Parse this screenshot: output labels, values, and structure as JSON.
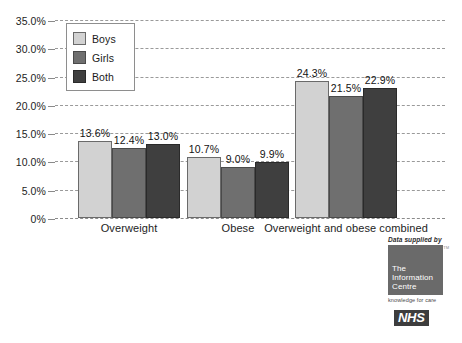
{
  "chart_data": {
    "type": "bar",
    "title": "",
    "xlabel": "",
    "ylabel": "",
    "ylim": [
      0,
      35
    ],
    "grid": true,
    "legend_position": "top-left",
    "categories": [
      "Overweight",
      "Obese",
      "Overweight and obese combined"
    ],
    "series": [
      {
        "name": "Boys",
        "color": "#d2d2d2",
        "values": [
          13.6,
          10.7,
          24.3
        ],
        "labels": [
          "13.6%",
          "10.7%",
          "24.3%"
        ]
      },
      {
        "name": "Girls",
        "color": "#6f6f6f",
        "values": [
          12.4,
          9.0,
          21.5
        ],
        "labels": [
          "12.4%",
          "9.0%",
          "21.5%"
        ]
      },
      {
        "name": "Both",
        "color": "#3f3f3f",
        "values": [
          13.0,
          9.9,
          22.9
        ],
        "labels": [
          "13.0%",
          "9.9%",
          "22.9%"
        ]
      }
    ],
    "yticks": [
      35,
      30,
      25,
      20,
      15,
      10,
      5,
      0
    ],
    "ytick_labels": [
      "35.0%",
      "30.0%",
      "25.0%",
      "20.0%",
      "15.0%",
      "10.0%",
      "5.0%",
      "0%"
    ]
  },
  "legend": {
    "items": [
      {
        "label": "Boys"
      },
      {
        "label": "Girls"
      },
      {
        "label": "Both"
      }
    ]
  },
  "logo": {
    "caption": "Data supplied by",
    "trademark": "TM",
    "box_line1": "The",
    "box_line2": "Information",
    "box_line3": "Centre",
    "tagline": "knowledge for care",
    "nhs": "NHS"
  }
}
